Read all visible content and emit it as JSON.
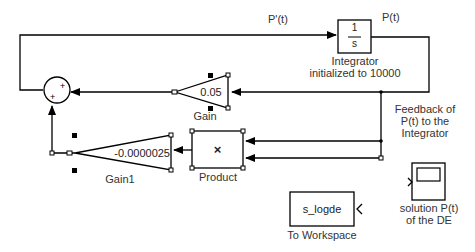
{
  "diagram": {
    "type": "simulink-block-diagram",
    "signals": {
      "derivative_label": "P'(t)",
      "output_label": "P(t)"
    },
    "blocks": {
      "sum": {
        "name": "Sum",
        "signs": [
          "+",
          "+"
        ]
      },
      "integrator": {
        "numerator": "1",
        "denominator": "s",
        "label_line1": "Integrator",
        "label_line2": "initialized to 10000"
      },
      "gain": {
        "value": "0.05",
        "label": "Gain"
      },
      "gain1": {
        "value": "-0.0000025",
        "label": "Gain1"
      },
      "product": {
        "symbol": "×",
        "label": "Product"
      },
      "to_workspace": {
        "variable": "s_logde",
        "label": "To Workspace"
      },
      "scope": {
        "label_line1": "solution P(t)",
        "label_line2": "of the DE"
      }
    },
    "annotations": {
      "feedback_line1": "Feedback of",
      "feedback_line2": "P(t) to the",
      "feedback_line3": "Integrator"
    },
    "colors": {
      "line": "#000000",
      "text": "#333333",
      "background": "#ffffff"
    }
  }
}
